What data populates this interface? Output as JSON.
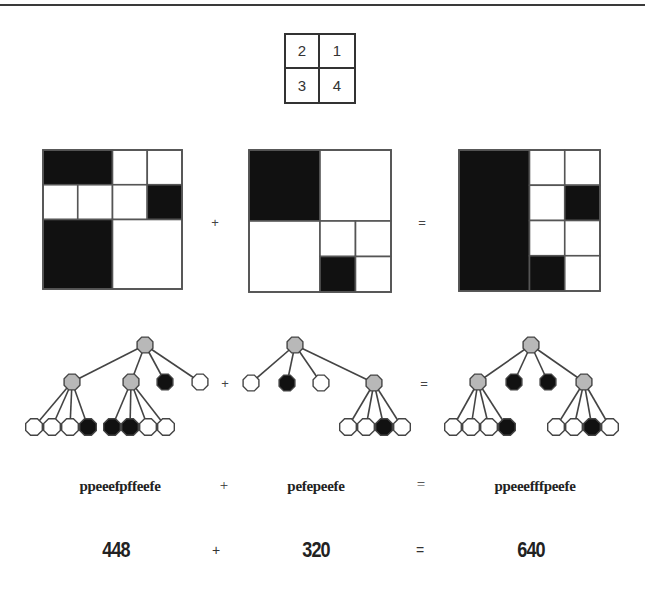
{
  "legend": {
    "quadrant_labels": [
      "2",
      "1",
      "3",
      "4"
    ]
  },
  "colors": {
    "black": "#111111",
    "white": "#ffffff",
    "gray": "#b8b8b8",
    "stroke": "#444444"
  },
  "grids": [
    {
      "name": "quadtree-image-a",
      "x": 43,
      "y": 150,
      "size": 139,
      "cells": [
        {
          "c": 0,
          "r": 0,
          "w": 2,
          "h": 1,
          "fill": "black"
        },
        {
          "c": 2,
          "r": 0,
          "w": 1,
          "h": 1,
          "fill": "white"
        },
        {
          "c": 3,
          "r": 0,
          "w": 1,
          "h": 1,
          "fill": "white"
        },
        {
          "c": 0,
          "r": 1,
          "w": 1,
          "h": 1,
          "fill": "white"
        },
        {
          "c": 1,
          "r": 1,
          "w": 1,
          "h": 1,
          "fill": "white"
        },
        {
          "c": 2,
          "r": 1,
          "w": 1,
          "h": 1,
          "fill": "white"
        },
        {
          "c": 3,
          "r": 1,
          "w": 1,
          "h": 1,
          "fill": "black"
        },
        {
          "c": 0,
          "r": 2,
          "w": 2,
          "h": 2,
          "fill": "black"
        },
        {
          "c": 2,
          "r": 2,
          "w": 2,
          "h": 2,
          "fill": "white"
        }
      ]
    },
    {
      "name": "quadtree-image-b",
      "x": 249,
      "y": 150,
      "size": 142,
      "cells": [
        {
          "c": 0,
          "r": 0,
          "w": 2,
          "h": 2,
          "fill": "black"
        },
        {
          "c": 2,
          "r": 0,
          "w": 2,
          "h": 2,
          "fill": "white"
        },
        {
          "c": 0,
          "r": 2,
          "w": 2,
          "h": 2,
          "fill": "white"
        },
        {
          "c": 2,
          "r": 2,
          "w": 1,
          "h": 1,
          "fill": "white"
        },
        {
          "c": 3,
          "r": 2,
          "w": 1,
          "h": 1,
          "fill": "white"
        },
        {
          "c": 2,
          "r": 3,
          "w": 1,
          "h": 1,
          "fill": "black"
        },
        {
          "c": 3,
          "r": 3,
          "w": 1,
          "h": 1,
          "fill": "white"
        }
      ]
    },
    {
      "name": "quadtree-image-sum",
      "x": 459,
      "y": 150,
      "size": 141,
      "cells": [
        {
          "c": 0,
          "r": 0,
          "w": 2,
          "h": 4,
          "fill": "black"
        },
        {
          "c": 2,
          "r": 0,
          "w": 1,
          "h": 1,
          "fill": "white"
        },
        {
          "c": 3,
          "r": 0,
          "w": 1,
          "h": 1,
          "fill": "white"
        },
        {
          "c": 2,
          "r": 1,
          "w": 1,
          "h": 1,
          "fill": "white"
        },
        {
          "c": 3,
          "r": 1,
          "w": 1,
          "h": 1,
          "fill": "black"
        },
        {
          "c": 2,
          "r": 2,
          "w": 1,
          "h": 1,
          "fill": "white"
        },
        {
          "c": 3,
          "r": 2,
          "w": 1,
          "h": 1,
          "fill": "white"
        },
        {
          "c": 2,
          "r": 3,
          "w": 1,
          "h": 1,
          "fill": "black"
        },
        {
          "c": 3,
          "r": 3,
          "w": 1,
          "h": 1,
          "fill": "white"
        }
      ],
      "outlines": [
        {
          "c": 0,
          "r": 0,
          "w": 2,
          "h": 2
        },
        {
          "c": 0,
          "r": 2,
          "w": 2,
          "h": 2
        }
      ]
    }
  ],
  "grid_operators": [
    {
      "symbol": "+",
      "x": 215,
      "y": 222
    },
    {
      "symbol": "=",
      "x": 422,
      "y": 222
    }
  ],
  "trees": [
    {
      "name": "quadtree-a",
      "nodes": [
        {
          "id": "r",
          "x": 145,
          "y": 345,
          "type": "p"
        },
        {
          "id": "a",
          "x": 72,
          "y": 382,
          "type": "p",
          "parent": "r"
        },
        {
          "id": "b",
          "x": 131,
          "y": 382,
          "type": "p",
          "parent": "r"
        },
        {
          "id": "c",
          "x": 165,
          "y": 382,
          "type": "f",
          "parent": "r"
        },
        {
          "id": "d",
          "x": 200,
          "y": 382,
          "type": "e",
          "parent": "r"
        },
        {
          "id": "a1",
          "x": 34,
          "y": 427,
          "type": "e",
          "parent": "a"
        },
        {
          "id": "a2",
          "x": 52,
          "y": 427,
          "type": "e",
          "parent": "a"
        },
        {
          "id": "a3",
          "x": 70,
          "y": 427,
          "type": "e",
          "parent": "a"
        },
        {
          "id": "a4",
          "x": 88,
          "y": 427,
          "type": "f",
          "parent": "a"
        },
        {
          "id": "b1",
          "x": 112,
          "y": 427,
          "type": "f",
          "parent": "b"
        },
        {
          "id": "b2",
          "x": 130,
          "y": 427,
          "type": "f",
          "parent": "b"
        },
        {
          "id": "b3",
          "x": 148,
          "y": 427,
          "type": "e",
          "parent": "b"
        },
        {
          "id": "b4",
          "x": 166,
          "y": 427,
          "type": "e",
          "parent": "b"
        }
      ]
    },
    {
      "name": "quadtree-b",
      "nodes": [
        {
          "id": "r",
          "x": 295,
          "y": 345,
          "type": "p"
        },
        {
          "id": "a",
          "x": 251,
          "y": 383,
          "type": "e",
          "parent": "r"
        },
        {
          "id": "b",
          "x": 287,
          "y": 383,
          "type": "f",
          "parent": "r"
        },
        {
          "id": "c",
          "x": 321,
          "y": 383,
          "type": "e",
          "parent": "r"
        },
        {
          "id": "d",
          "x": 374,
          "y": 383,
          "type": "p",
          "parent": "r"
        },
        {
          "id": "d1",
          "x": 348,
          "y": 427,
          "type": "e",
          "parent": "d"
        },
        {
          "id": "d2",
          "x": 366,
          "y": 427,
          "type": "e",
          "parent": "d"
        },
        {
          "id": "d3",
          "x": 384,
          "y": 427,
          "type": "f",
          "parent": "d"
        },
        {
          "id": "d4",
          "x": 402,
          "y": 427,
          "type": "e",
          "parent": "d"
        }
      ]
    },
    {
      "name": "quadtree-sum",
      "nodes": [
        {
          "id": "r",
          "x": 531,
          "y": 345,
          "type": "p"
        },
        {
          "id": "a",
          "x": 478,
          "y": 382,
          "type": "p",
          "parent": "r"
        },
        {
          "id": "b",
          "x": 514,
          "y": 382,
          "type": "f",
          "parent": "r"
        },
        {
          "id": "c",
          "x": 548,
          "y": 382,
          "type": "f",
          "parent": "r"
        },
        {
          "id": "d",
          "x": 584,
          "y": 382,
          "type": "p",
          "parent": "r"
        },
        {
          "id": "a1",
          "x": 453,
          "y": 427,
          "type": "e",
          "parent": "a"
        },
        {
          "id": "a2",
          "x": 471,
          "y": 427,
          "type": "e",
          "parent": "a"
        },
        {
          "id": "a3",
          "x": 489,
          "y": 427,
          "type": "e",
          "parent": "a"
        },
        {
          "id": "a4",
          "x": 507,
          "y": 427,
          "type": "f",
          "parent": "a"
        },
        {
          "id": "d1",
          "x": 556,
          "y": 427,
          "type": "e",
          "parent": "d"
        },
        {
          "id": "d2",
          "x": 574,
          "y": 427,
          "type": "e",
          "parent": "d"
        },
        {
          "id": "d3",
          "x": 592,
          "y": 427,
          "type": "f",
          "parent": "d"
        },
        {
          "id": "d4",
          "x": 610,
          "y": 427,
          "type": "e",
          "parent": "d"
        }
      ]
    }
  ],
  "tree_operators": [
    {
      "symbol": "+",
      "x": 225,
      "y": 383
    },
    {
      "symbol": "=",
      "x": 424,
      "y": 383
    }
  ],
  "codes": {
    "a": "ppeeefpffeefe",
    "plus": "+",
    "b": "pefepeefe",
    "equals": "=",
    "sum": "ppeeefffpeefe"
  },
  "numbers": {
    "a": "448",
    "plus": "+",
    "b": "320",
    "equals": "=",
    "sum": "640"
  }
}
